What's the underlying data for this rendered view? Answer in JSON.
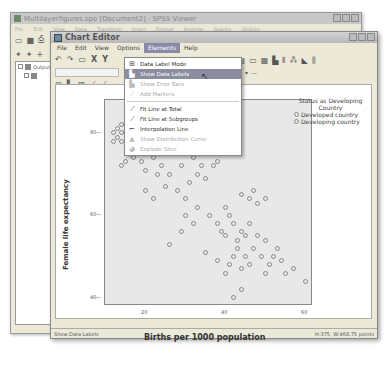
{
  "bg_window": {
    "title": "Multilayerfigures.spo [Document2] - SPSS Viewer",
    "menu": [
      "File",
      "Edit",
      "View",
      "Data",
      "Transform",
      "Insert",
      "Format",
      "Analyze",
      "Graphs",
      "Utilities",
      "Add-ons",
      "Window",
      "Help"
    ],
    "tree": [
      {
        "label": "Output"
      },
      {
        "label": ""
      }
    ]
  },
  "chart_editor": {
    "title": "Chart Editor",
    "menu": [
      "File",
      "Edit",
      "View",
      "Options",
      "Elements",
      "Help"
    ],
    "active_menu": "Elements"
  },
  "elements_menu": {
    "items": [
      {
        "label": "Data Label Mode",
        "icon": "data-label-mode-icon",
        "state": "normal"
      },
      {
        "label": "Show Data Labels",
        "icon": "show-data-labels-icon",
        "state": "highlighted"
      },
      {
        "label": "Show Error Bars",
        "icon": "error-bars-icon",
        "state": "disabled"
      },
      {
        "label": "Add Markers",
        "icon": "add-markers-icon",
        "state": "disabled"
      },
      {
        "label": "Fit Line at Total",
        "icon": "fit-line-total-icon",
        "state": "normal"
      },
      {
        "label": "Fit Line at Subgroups",
        "icon": "fit-line-subgroups-icon",
        "state": "normal"
      },
      {
        "label": "Interpolation Line",
        "icon": "interpolation-line-icon",
        "state": "normal"
      },
      {
        "label": "Show Distribution Curve",
        "icon": "distribution-curve-icon",
        "state": "disabled"
      },
      {
        "label": "Explode Slice",
        "icon": "explode-slice-icon",
        "state": "disabled"
      }
    ]
  },
  "status_bar": {
    "left": "Show Data Labels",
    "right": "H:375, W:468.75 points"
  },
  "chart_data": {
    "type": "scatter",
    "title": "",
    "xlabel": "Births per 1000 population",
    "ylabel": "Female life expectancy",
    "xlim": [
      10,
      62
    ],
    "ylim": [
      38,
      88
    ],
    "xticks": [
      20,
      40,
      60
    ],
    "yticks": [
      40,
      60,
      80
    ],
    "legend": {
      "title": "Status as Developing Country",
      "entries": [
        "Developed country",
        "Developing country"
      ],
      "position": "right"
    },
    "grid": false,
    "series": [
      {
        "name": "Developing country",
        "points": [
          [
            12,
            80
          ],
          [
            13,
            81
          ],
          [
            14,
            82
          ],
          [
            15,
            80
          ],
          [
            13,
            79
          ],
          [
            14,
            78
          ],
          [
            16,
            83
          ],
          [
            15,
            82
          ],
          [
            16,
            80
          ],
          [
            17,
            81
          ],
          [
            18,
            80
          ],
          [
            12,
            78
          ],
          [
            14,
            80
          ],
          [
            16,
            78
          ],
          [
            18,
            77
          ],
          [
            20,
            79
          ],
          [
            21,
            76
          ],
          [
            22,
            74
          ],
          [
            17,
            74
          ],
          [
            19,
            73
          ],
          [
            16,
            75
          ],
          [
            14,
            72
          ],
          [
            15,
            73
          ],
          [
            20,
            71
          ],
          [
            23,
            70
          ],
          [
            26,
            75
          ],
          [
            25,
            79
          ],
          [
            27,
            80
          ],
          [
            28,
            78
          ],
          [
            30,
            76
          ],
          [
            32,
            74
          ],
          [
            29,
            72
          ],
          [
            24,
            72
          ],
          [
            26,
            70
          ],
          [
            25,
            67
          ],
          [
            20,
            66
          ],
          [
            22,
            64
          ],
          [
            30,
            64
          ],
          [
            28,
            66
          ],
          [
            35,
            77
          ],
          [
            36,
            75
          ],
          [
            38,
            73
          ],
          [
            34,
            72
          ],
          [
            33,
            70
          ],
          [
            37,
            72
          ],
          [
            35,
            69
          ],
          [
            31,
            68
          ],
          [
            30,
            60
          ],
          [
            32,
            58
          ],
          [
            33,
            62
          ],
          [
            36,
            60
          ],
          [
            40,
            62
          ],
          [
            41,
            60
          ],
          [
            38,
            58
          ],
          [
            39,
            56
          ],
          [
            40,
            55
          ],
          [
            42,
            58
          ],
          [
            43,
            54
          ],
          [
            44,
            56
          ],
          [
            45,
            55
          ],
          [
            46,
            58
          ],
          [
            42,
            50
          ],
          [
            43,
            52
          ],
          [
            45,
            50
          ],
          [
            46,
            48
          ],
          [
            41,
            48
          ],
          [
            40,
            46
          ],
          [
            44,
            47
          ],
          [
            47,
            52
          ],
          [
            48,
            55
          ],
          [
            50,
            54
          ],
          [
            49,
            50
          ],
          [
            51,
            48
          ],
          [
            52,
            50
          ],
          [
            53,
            52
          ],
          [
            54,
            49
          ],
          [
            50,
            46
          ],
          [
            55,
            46
          ],
          [
            57,
            47
          ],
          [
            60,
            44
          ],
          [
            44,
            42
          ],
          [
            42,
            40
          ],
          [
            38,
            49
          ],
          [
            35,
            51
          ],
          [
            29,
            56
          ],
          [
            26,
            53
          ],
          [
            44,
            65
          ],
          [
            46,
            64
          ],
          [
            48,
            63
          ],
          [
            47,
            66
          ],
          [
            50,
            64
          ]
        ]
      }
    ]
  }
}
